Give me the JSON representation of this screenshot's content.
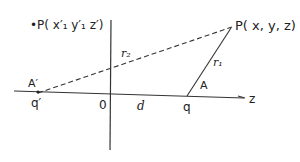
{
  "diagram": {
    "point_p": "P( x, y, z)",
    "point_p_image": "•P( x′₁ y′₁ z′)",
    "r1": "r₁",
    "r2": "r₂",
    "angle_a": "A",
    "angle_a_image": "A′",
    "charge_q": "q",
    "charge_q_image": "q′",
    "origin": "0",
    "distance": "d",
    "axis_z": "z"
  }
}
